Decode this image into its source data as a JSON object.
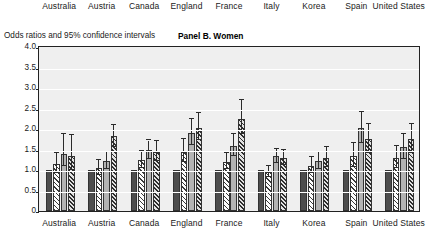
{
  "top_strip": {
    "labels": [
      "Australia",
      "Austria",
      "Canada",
      "England",
      "France",
      "Italy",
      "Korea",
      "Spain",
      "United States"
    ]
  },
  "caption": {
    "axis_caption": "Odds ratios and 95% confidence intervals",
    "panel_title": "Panel B. Women"
  },
  "chart_data": {
    "type": "bar",
    "title": "Panel B. Women",
    "xlabel": "",
    "ylabel": "Odds ratios and 95% confidence intervals",
    "ylim": [
      0,
      4.0
    ],
    "ytick_labels": [
      "0",
      "0.5",
      "1.0",
      "1.5",
      "2.0",
      "2.5",
      "3.0",
      "3.5",
      "4.0"
    ],
    "ytick_values": [
      0,
      0.5,
      1.0,
      1.5,
      2.0,
      2.5,
      3.0,
      3.5,
      4.0
    ],
    "grid": true,
    "legend_position": "none",
    "categories": [
      "Australia",
      "Austria",
      "Canada",
      "England",
      "France",
      "Italy",
      "Korea",
      "Spain",
      "United States"
    ],
    "series": [
      {
        "name": "Quartile 1 (reference)",
        "pattern": "dark-solid",
        "values": [
          1.0,
          1.0,
          1.0,
          1.0,
          1.0,
          1.0,
          1.0,
          1.0,
          1.0
        ],
        "ci_low": [
          null,
          null,
          null,
          null,
          null,
          null,
          null,
          null,
          null
        ],
        "ci_high": [
          null,
          null,
          null,
          null,
          null,
          null,
          null,
          null,
          null
        ]
      },
      {
        "name": "Quartile 2",
        "pattern": "light-hatch",
        "values": [
          1.14,
          1.05,
          1.25,
          1.45,
          1.2,
          0.95,
          1.1,
          1.35,
          1.3
        ],
        "ci_low": [
          0.92,
          0.88,
          1.05,
          1.2,
          1.02,
          0.82,
          0.92,
          1.08,
          1.05
        ],
        "ci_high": [
          1.42,
          1.25,
          1.47,
          1.75,
          1.42,
          1.1,
          1.32,
          1.65,
          1.58
        ]
      },
      {
        "name": "Quartile 3",
        "pattern": "mid-solid",
        "values": [
          1.4,
          1.22,
          1.5,
          1.9,
          1.58,
          1.35,
          1.22,
          2.02,
          1.55
        ],
        "ci_low": [
          1.1,
          1.02,
          1.28,
          1.6,
          1.33,
          1.18,
          1.02,
          1.65,
          1.28
        ],
        "ci_high": [
          1.88,
          1.45,
          1.72,
          2.25,
          1.88,
          1.52,
          1.45,
          2.42,
          1.88
        ]
      },
      {
        "name": "Quartile 4",
        "pattern": "dense-hatch",
        "values": [
          1.35,
          1.82,
          1.45,
          2.02,
          2.25,
          1.3,
          1.3,
          1.75,
          1.75
        ],
        "ci_low": [
          1.0,
          1.55,
          1.22,
          1.72,
          1.88,
          1.12,
          1.08,
          1.42,
          1.42
        ],
        "ci_high": [
          1.85,
          2.1,
          1.7,
          2.38,
          2.7,
          1.48,
          1.55,
          2.12,
          2.12
        ]
      }
    ]
  }
}
